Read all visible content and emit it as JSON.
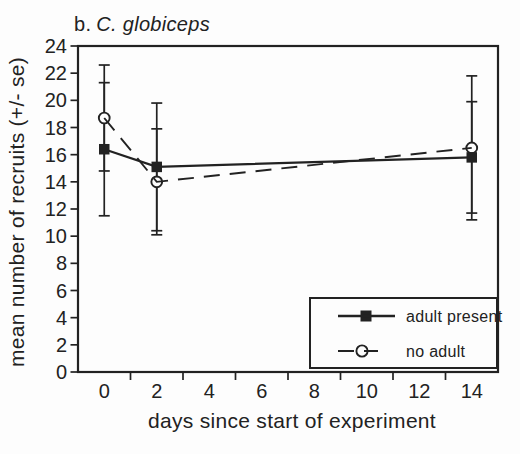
{
  "figure": {
    "title_prefix": "b.",
    "title_species": "C. globiceps"
  },
  "chart_data": {
    "type": "line",
    "xlabel": "days since start of experiment",
    "ylabel": "mean number of recruits (+/- se)",
    "xlim": [
      -1,
      15
    ],
    "ylim": [
      0,
      24
    ],
    "grid": false,
    "x": [
      0,
      2,
      14
    ],
    "series": [
      {
        "name": "adult present",
        "marker": "filled-square",
        "line_style": "solid",
        "values": [
          16.4,
          15.1,
          15.8
        ],
        "se": [
          4.9,
          4.7,
          4.1
        ]
      },
      {
        "name": "no adult",
        "marker": "open-circle",
        "line_style": "dashed",
        "values": [
          18.7,
          14.0,
          16.5
        ],
        "se": [
          3.9,
          3.9,
          5.3
        ]
      }
    ],
    "x_tick_labels": [
      "0",
      "2",
      "4",
      "6",
      "8",
      "10",
      "12",
      "14"
    ],
    "x_tick_label_positions": [
      0,
      2,
      4,
      6,
      8,
      10,
      12,
      14
    ],
    "x_minor_tick_positions": [
      1,
      3,
      5,
      7,
      9,
      11,
      13
    ],
    "y_tick_labels": [
      "0",
      "2",
      "4",
      "6",
      "8",
      "10",
      "12",
      "14",
      "16",
      "18",
      "20",
      "22",
      "24"
    ],
    "y_tick_positions": [
      0,
      2,
      4,
      6,
      8,
      10,
      12,
      14,
      16,
      18,
      20,
      22,
      24
    ],
    "legend": {
      "position": "lower-right"
    }
  },
  "colors": {
    "ink": "#222222",
    "paper": "#fdfdfd"
  }
}
